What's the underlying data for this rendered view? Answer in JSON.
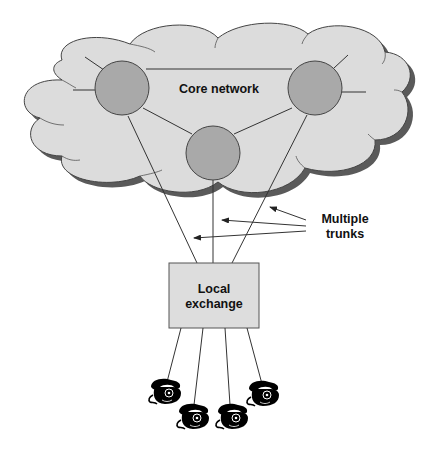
{
  "diagram": {
    "colors": {
      "cloud_fill": "#dcdcdc",
      "cloud_shadow": "#5a5a5a",
      "node_fill": "#a9a9a9",
      "line": "#333333",
      "exchange_fill": "#dddddd",
      "phone": "#000000"
    },
    "nodes": [
      {
        "id": "core",
        "label": "Core network",
        "type": "cloud"
      },
      {
        "id": "node-left",
        "label": "",
        "type": "switch-node"
      },
      {
        "id": "node-right",
        "label": "",
        "type": "switch-node"
      },
      {
        "id": "node-center",
        "label": "",
        "type": "switch-node"
      },
      {
        "id": "exchange",
        "label_line1": "Local",
        "label_line2": "exchange",
        "type": "box"
      },
      {
        "id": "phone-1",
        "type": "telephone-icon"
      },
      {
        "id": "phone-2",
        "type": "telephone-icon"
      },
      {
        "id": "phone-3",
        "type": "telephone-icon"
      },
      {
        "id": "phone-4",
        "type": "telephone-icon"
      }
    ],
    "edges": [
      {
        "from": "node-left",
        "to": "node-right"
      },
      {
        "from": "node-left",
        "to": "node-center"
      },
      {
        "from": "node-center",
        "to": "node-right"
      },
      {
        "from": "node-left",
        "to": "exchange",
        "kind": "trunk"
      },
      {
        "from": "node-center",
        "to": "exchange",
        "kind": "trunk"
      },
      {
        "from": "node-right",
        "to": "exchange",
        "kind": "trunk"
      },
      {
        "from": "exchange",
        "to": "phone-1"
      },
      {
        "from": "exchange",
        "to": "phone-2"
      },
      {
        "from": "exchange",
        "to": "phone-3"
      },
      {
        "from": "exchange",
        "to": "phone-4"
      }
    ],
    "labels": {
      "core": "Core network",
      "exchange_line1": "Local",
      "exchange_line2": "exchange",
      "trunks_line1": "Multiple",
      "trunks_line2": "trunks"
    },
    "annotation": {
      "text": "Multiple trunks",
      "arrow_count": 3,
      "points_to": "trunk lines"
    }
  }
}
